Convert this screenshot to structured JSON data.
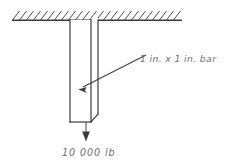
{
  "figure": {
    "labels": {
      "bar_label": "1 in. x 1 in. bar",
      "load_label": "10 000 lb"
    },
    "colors": {
      "background": "#ffffff",
      "line": "#3c3c44",
      "hatch": "#4a4a52",
      "text": "#6d6d75",
      "arrow": "#3a3a42"
    },
    "support": {
      "type": "fixed-support-hatching",
      "line_y": 20,
      "line_x_start": 12,
      "line_x_end": 182,
      "hatch_count": 24,
      "hatch_direction": "up-right"
    },
    "bar": {
      "shape": "rectangular-prism-isometric",
      "cross_section": "1 in. x 1 in.",
      "front_left_x": 70,
      "front_right_x": 91,
      "back_right_x": 98,
      "top_y": 20,
      "front_bottom_y": 122,
      "back_bottom_y": 114
    },
    "load": {
      "magnitude": "10 000",
      "unit": "lb",
      "direction": "downward",
      "applied_at_x": 86,
      "arrow_start_y": 122,
      "arrow_end_y": 141
    },
    "leader": {
      "from_x": 146,
      "from_y": 55,
      "to_x": 79,
      "to_y": 89
    }
  }
}
